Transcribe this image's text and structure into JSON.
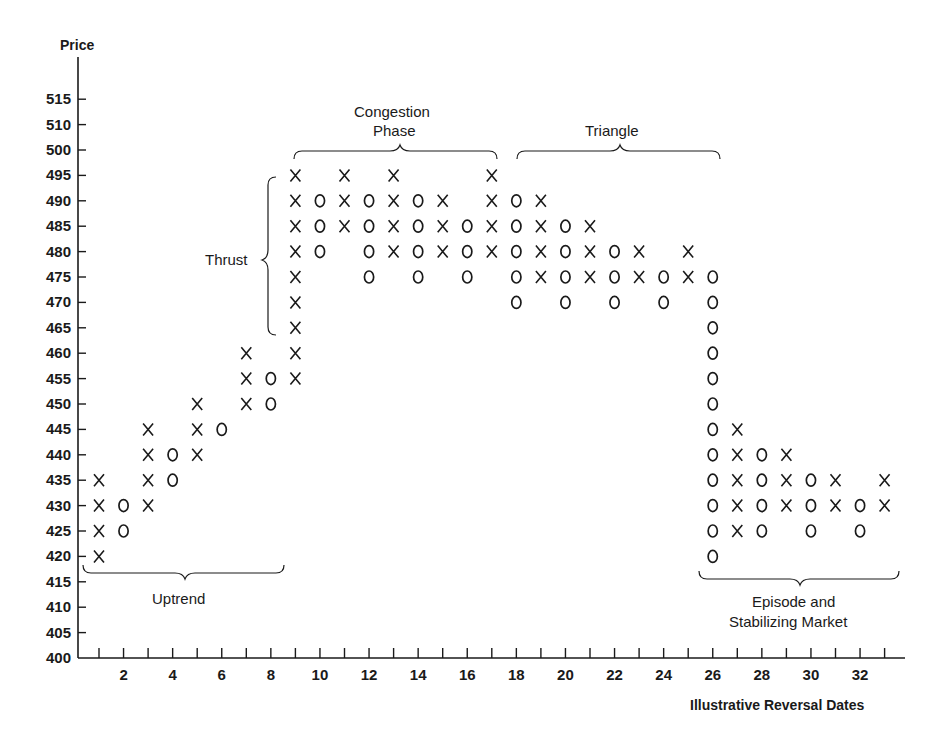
{
  "chart_data": {
    "type": "point-and-figure",
    "title": "",
    "ylabel": "Price",
    "xlabel": "Illustrative Reversal Dates",
    "y_tick_labels": [
      "400",
      "405",
      "410",
      "415",
      "420",
      "425",
      "430",
      "435",
      "440",
      "445",
      "450",
      "455",
      "460",
      "465",
      "470",
      "475",
      "480",
      "485",
      "490",
      "495",
      "500",
      "510",
      "515"
    ],
    "x_tick_labels": [
      "2",
      "4",
      "6",
      "8",
      "10",
      "12",
      "14",
      "16",
      "18",
      "20",
      "22",
      "24",
      "26",
      "28",
      "30",
      "32"
    ],
    "x_range": [
      1,
      33
    ],
    "grid": false,
    "columns": [
      {
        "x": 1,
        "mark": "X",
        "from": 420,
        "to": 435
      },
      {
        "x": 2,
        "mark": "O",
        "from": 425,
        "to": 430
      },
      {
        "x": 3,
        "mark": "X",
        "from": 430,
        "to": 445
      },
      {
        "x": 4,
        "mark": "O",
        "from": 435,
        "to": 440
      },
      {
        "x": 5,
        "mark": "X",
        "from": 440,
        "to": 450
      },
      {
        "x": 6,
        "mark": "O",
        "from": 445,
        "to": 445
      },
      {
        "x": 7,
        "mark": "X",
        "from": 450,
        "to": 460
      },
      {
        "x": 8,
        "mark": "O",
        "from": 450,
        "to": 455
      },
      {
        "x": 9,
        "mark": "X",
        "from": 455,
        "to": 495
      },
      {
        "x": 10,
        "mark": "O",
        "from": 480,
        "to": 490
      },
      {
        "x": 11,
        "mark": "X",
        "from": 485,
        "to": 495
      },
      {
        "x": 12,
        "mark": "O",
        "from": 475,
        "to": 490
      },
      {
        "x": 13,
        "mark": "X",
        "from": 480,
        "to": 495
      },
      {
        "x": 14,
        "mark": "O",
        "from": 475,
        "to": 490
      },
      {
        "x": 15,
        "mark": "X",
        "from": 480,
        "to": 490
      },
      {
        "x": 16,
        "mark": "O",
        "from": 475,
        "to": 485
      },
      {
        "x": 17,
        "mark": "X",
        "from": 480,
        "to": 495
      },
      {
        "x": 18,
        "mark": "O",
        "from": 470,
        "to": 490
      },
      {
        "x": 19,
        "mark": "X",
        "from": 475,
        "to": 490
      },
      {
        "x": 20,
        "mark": "O",
        "from": 470,
        "to": 485
      },
      {
        "x": 21,
        "mark": "X",
        "from": 475,
        "to": 485
      },
      {
        "x": 22,
        "mark": "O",
        "from": 470,
        "to": 480
      },
      {
        "x": 23,
        "mark": "X",
        "from": 475,
        "to": 480
      },
      {
        "x": 24,
        "mark": "O",
        "from": 470,
        "to": 475
      },
      {
        "x": 25,
        "mark": "X",
        "from": 475,
        "to": 480
      },
      {
        "x": 26,
        "mark": "O",
        "from": 420,
        "to": 475
      },
      {
        "x": 27,
        "mark": "X",
        "from": 425,
        "to": 445
      },
      {
        "x": 28,
        "mark": "O",
        "from": 425,
        "to": 440
      },
      {
        "x": 29,
        "mark": "X",
        "from": 430,
        "to": 440
      },
      {
        "x": 30,
        "mark": "O",
        "from": 425,
        "to": 435
      },
      {
        "x": 31,
        "mark": "X",
        "from": 430,
        "to": 435
      },
      {
        "x": 32,
        "mark": "O",
        "from": 425,
        "to": 430
      },
      {
        "x": 33,
        "mark": "X",
        "from": 430,
        "to": 435
      }
    ],
    "annotations": [
      {
        "text": "Uptrend",
        "brace": "horizontal-below",
        "x_from": 0.5,
        "x_to": 8.5,
        "y": 417
      },
      {
        "text": "Thrust",
        "brace": "vertical-left",
        "x": 9,
        "y_from": 465,
        "y_to": 495
      },
      {
        "text": "Congestion Phase",
        "brace": "horizontal-above",
        "x_from": 9,
        "x_to": 17,
        "y": 500
      },
      {
        "text": "Triangle",
        "brace": "horizontal-above",
        "x_from": 18,
        "x_to": 26,
        "y": 500
      },
      {
        "text": "Episode and Stabilizing Market",
        "brace": "horizontal-below",
        "x_from": 26,
        "x_to": 33,
        "y": 417
      }
    ]
  },
  "labels": {
    "y_axis_title": "Price",
    "x_axis_title": "Illustrative Reversal Dates",
    "uptrend": "Uptrend",
    "thrust": "Thrust",
    "congestion_line1": "Congestion",
    "congestion_line2": "Phase",
    "triangle": "Triangle",
    "episode_line1": "Episode and",
    "episode_line2": "Stabilizing Market"
  }
}
